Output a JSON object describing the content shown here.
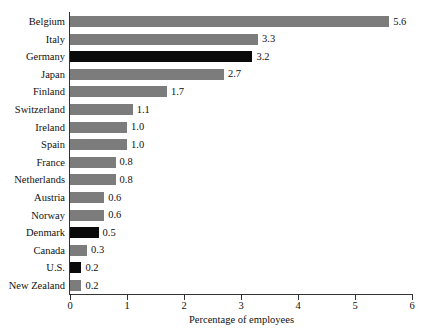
{
  "chart_data": {
    "type": "bar",
    "orientation": "horizontal",
    "title": "",
    "xlabel": "Percentage of employees",
    "ylabel": "",
    "xlim": [
      0,
      6
    ],
    "xticks": [
      0,
      1,
      2,
      3,
      4,
      5,
      6
    ],
    "xtick_labels": [
      "0",
      "1",
      "2",
      "3",
      "4",
      "5",
      "6"
    ],
    "grid": false,
    "legend": null,
    "categories": [
      "Belgium",
      "Italy",
      "Germany",
      "Japan",
      "Finland",
      "Switzerland",
      "Ireland",
      "Spain",
      "France",
      "Netherlands",
      "Austria",
      "Norway",
      "Denmark",
      "Canada",
      "U.S.",
      "New Zealand"
    ],
    "values": [
      5.6,
      3.3,
      3.2,
      2.7,
      1.7,
      1.1,
      1.0,
      1.0,
      0.8,
      0.8,
      0.6,
      0.6,
      0.5,
      0.3,
      0.2,
      0.2
    ],
    "value_labels": [
      "5.6",
      "3.3",
      "3.2",
      "2.7",
      "1.7",
      "1.1",
      "1.0",
      "1.0",
      "0.8",
      "0.8",
      "0.6",
      "0.6",
      "0.5",
      "0.3",
      "0.2",
      "0.2"
    ],
    "bar_colors": [
      "#7c7c7c",
      "#7c7c7c",
      "#0a0a0a",
      "#7c7c7c",
      "#7c7c7c",
      "#7c7c7c",
      "#7c7c7c",
      "#7c7c7c",
      "#7c7c7c",
      "#7c7c7c",
      "#7c7c7c",
      "#7c7c7c",
      "#0a0a0a",
      "#7c7c7c",
      "#0a0a0a",
      "#7c7c7c"
    ],
    "colors": {
      "bar_gray": "#7c7c7c",
      "bar_black": "#0a0a0a",
      "axis": "#333333",
      "text": "#111111",
      "background": "#ffffff"
    }
  }
}
